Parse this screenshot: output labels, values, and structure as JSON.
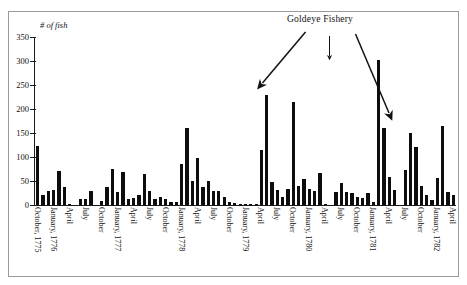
{
  "figure": {
    "annotation_title": "Goldeye Fishery",
    "bar_color": "#0d0d0d",
    "axis_color": "#1a1a1a",
    "frame_color": "#9a9a9a",
    "background": "#ffffff"
  },
  "chart_data": {
    "type": "bar",
    "title": "Goldeye Fishery",
    "xlabel": "",
    "ylabel": "# of fish",
    "ylim": [
      0,
      350
    ],
    "yticks": [
      0,
      50,
      100,
      150,
      200,
      250,
      300,
      350
    ],
    "ytick_labels": [
      "0",
      "50",
      "100",
      "150",
      "200",
      "250",
      "300",
      "350"
    ],
    "grid": false,
    "legend": "none",
    "tick_labels_rotated": true,
    "x_tick_labels": [
      {
        "index": 0,
        "label": "October, 1775"
      },
      {
        "index": 3,
        "label": "January, 1776"
      },
      {
        "index": 6,
        "label": "April"
      },
      {
        "index": 9,
        "label": "July"
      },
      {
        "index": 12,
        "label": "October"
      },
      {
        "index": 15,
        "label": "January, 1777"
      },
      {
        "index": 18,
        "label": "April"
      },
      {
        "index": 21,
        "label": "July"
      },
      {
        "index": 24,
        "label": "October"
      },
      {
        "index": 27,
        "label": "January, 1778"
      },
      {
        "index": 30,
        "label": "April"
      },
      {
        "index": 33,
        "label": "July"
      },
      {
        "index": 36,
        "label": "October"
      },
      {
        "index": 39,
        "label": "January, 1779"
      },
      {
        "index": 42,
        "label": "April"
      },
      {
        "index": 45,
        "label": "July"
      },
      {
        "index": 48,
        "label": "October"
      },
      {
        "index": 51,
        "label": "January, 1780"
      },
      {
        "index": 54,
        "label": "April"
      },
      {
        "index": 57,
        "label": "July"
      },
      {
        "index": 60,
        "label": "October"
      },
      {
        "index": 63,
        "label": "January, 1781"
      },
      {
        "index": 66,
        "label": "April"
      },
      {
        "index": 69,
        "label": "July"
      },
      {
        "index": 72,
        "label": "October"
      },
      {
        "index": 75,
        "label": "January, 1782"
      },
      {
        "index": 78,
        "label": "April"
      }
    ],
    "categories": [
      "October, 1775",
      "November, 1775",
      "December, 1775",
      "January, 1776",
      "February, 1776",
      "March, 1776",
      "April, 1776",
      "May, 1776",
      "June, 1776",
      "July, 1776",
      "August, 1776",
      "September, 1776",
      "October, 1776",
      "November, 1776",
      "December, 1776",
      "January, 1777",
      "February, 1777",
      "March, 1777",
      "April, 1777",
      "May, 1777",
      "June, 1777",
      "July, 1777",
      "August, 1777",
      "September, 1777",
      "October, 1777",
      "November, 1777",
      "December, 1777",
      "January, 1778",
      "February, 1778",
      "March, 1778",
      "April, 1778",
      "May, 1778",
      "June, 1778",
      "July, 1778",
      "August, 1778",
      "September, 1778",
      "October, 1778",
      "November, 1778",
      "December, 1778",
      "January, 1779",
      "February, 1779",
      "March, 1779",
      "April, 1779",
      "May, 1779",
      "June, 1779",
      "July, 1779",
      "August, 1779",
      "September, 1779",
      "October, 1779",
      "November, 1779",
      "December, 1779",
      "January, 1780",
      "February, 1780",
      "March, 1780",
      "April, 1780",
      "May, 1780",
      "June, 1780",
      "July, 1780",
      "August, 1780",
      "September, 1780",
      "October, 1780",
      "November, 1780",
      "December, 1780",
      "January, 1781",
      "February, 1781",
      "March, 1781",
      "April, 1781",
      "May, 1781",
      "June, 1781",
      "July, 1781",
      "August, 1781",
      "September, 1781",
      "October, 1781",
      "November, 1781",
      "December, 1781",
      "January, 1782",
      "February, 1782",
      "March, 1782",
      "April, 1782"
    ],
    "values": [
      122,
      20,
      30,
      31,
      71,
      37,
      2,
      0,
      12,
      13,
      29,
      0,
      8,
      38,
      74,
      27,
      69,
      13,
      14,
      21,
      64,
      30,
      13,
      17,
      12,
      7,
      6,
      85,
      161,
      51,
      98,
      38,
      51,
      30,
      30,
      17,
      7,
      4,
      3,
      2,
      1,
      3,
      115,
      230,
      47,
      32,
      16,
      34,
      214,
      40,
      54,
      33,
      29,
      67,
      2,
      0,
      27,
      45,
      28,
      26,
      17,
      14,
      24,
      7,
      302,
      161,
      59,
      31,
      0,
      72,
      150,
      121,
      40,
      21,
      10,
      56,
      164,
      28,
      21
    ],
    "arrow_annotations": [
      {
        "label": "Goldeye Fishery",
        "target_index": 48,
        "target_value": 214,
        "direction": "down-left"
      },
      {
        "label": "Goldeye Fishery",
        "target_index": 64,
        "target_value": 302,
        "direction": "down"
      },
      {
        "label": "Goldeye Fishery",
        "target_index": 77,
        "target_value": 164,
        "direction": "down-right"
      }
    ]
  }
}
